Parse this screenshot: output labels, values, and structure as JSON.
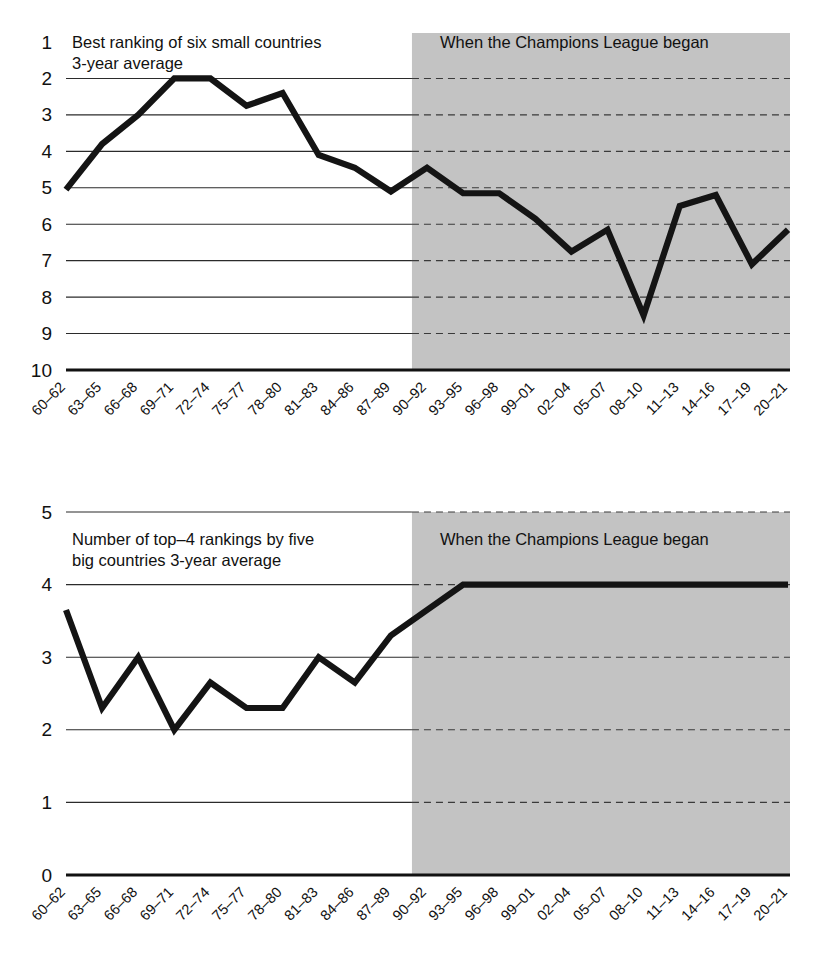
{
  "figure": {
    "width": 818,
    "height": 971,
    "background": "#ffffff",
    "line_color": "#141414",
    "shade_color": "#c3c3c3",
    "grid_color": "#2b2b2b"
  },
  "categories": [
    "60–62",
    "63–65",
    "66–68",
    "69–71",
    "72–74",
    "75–77",
    "78–80",
    "81–83",
    "84–86",
    "87–89",
    "90–92",
    "93–95",
    "96–98",
    "99–01",
    "02–04",
    "05–07",
    "08–10",
    "11–13",
    "14–16",
    "17–19",
    "20–21"
  ],
  "shade_label": "When the Champions League began",
  "shade_start_category": "90–92",
  "top_panel": {
    "title_line1": "Best ranking of six small countries",
    "title_line2": "3-year average",
    "shade_label": "When the Champions League began",
    "y_ticks": [
      "1",
      "2",
      "3",
      "4",
      "5",
      "6",
      "7",
      "8",
      "9",
      "10"
    ]
  },
  "bottom_panel": {
    "title_line1": "Number of top–4 rankings by five",
    "title_line2": "big countries 3-year average",
    "shade_label": "When the Champions League began",
    "y_ticks": [
      "5",
      "4",
      "3",
      "2",
      "1",
      "0"
    ]
  },
  "chart_data": [
    {
      "type": "line",
      "title": "Best ranking of six small countries 3-year average",
      "xlabel": "",
      "ylabel": "Best ranking",
      "ylim": [
        10,
        1
      ],
      "y_inverted": true,
      "y_ticks": [
        1,
        2,
        3,
        4,
        5,
        6,
        7,
        8,
        9,
        10
      ],
      "grid": true,
      "annotation": "When the Champions League began",
      "annotation_span": [
        "90–92",
        "20–21"
      ],
      "categories": [
        "60–62",
        "63–65",
        "66–68",
        "69–71",
        "72–74",
        "75–77",
        "78–80",
        "81–83",
        "84–86",
        "87–89",
        "90–92",
        "93–95",
        "96–98",
        "99–01",
        "02–04",
        "05–07",
        "08–10",
        "11–13",
        "14–16",
        "17–19",
        "20–21"
      ],
      "values": [
        5.05,
        3.8,
        3.0,
        2.0,
        2.0,
        2.75,
        2.4,
        4.1,
        4.45,
        5.1,
        4.45,
        5.15,
        5.15,
        5.85,
        6.75,
        6.15,
        8.5,
        5.5,
        5.2,
        7.1,
        6.15
      ]
    },
    {
      "type": "line",
      "title": "Number of top–4 rankings by five big countries 3-year average",
      "xlabel": "",
      "ylabel": "Number of top-4 rankings",
      "ylim": [
        0,
        5
      ],
      "y_inverted": false,
      "y_ticks": [
        0,
        1,
        2,
        3,
        4,
        5
      ],
      "grid": true,
      "annotation": "When the Champions League began",
      "annotation_span": [
        "90–92",
        "20–21"
      ],
      "categories": [
        "60–62",
        "63–65",
        "66–68",
        "69–71",
        "72–74",
        "75–77",
        "78–80",
        "81–83",
        "84–86",
        "87–89",
        "90–92",
        "93–95",
        "96–98",
        "99–01",
        "02–04",
        "05–07",
        "08–10",
        "11–13",
        "14–16",
        "17–19",
        "20–21"
      ],
      "values": [
        3.65,
        2.3,
        3.0,
        2.0,
        2.65,
        2.3,
        2.3,
        3.0,
        2.65,
        3.3,
        3.65,
        4.0,
        4.0,
        4.0,
        4.0,
        4.0,
        4.0,
        4.0,
        4.0,
        4.0,
        4.0
      ]
    }
  ]
}
